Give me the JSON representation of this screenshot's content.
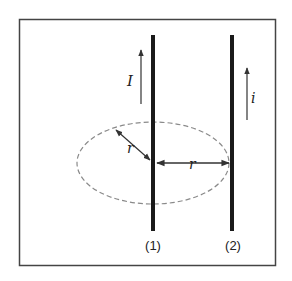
{
  "diagram": {
    "type": "physics-two-parallel-wires",
    "frame": {
      "x": 19,
      "y": 19,
      "width": 256,
      "height": 246,
      "stroke": "#444444"
    },
    "wires": [
      {
        "id": "wire-1",
        "label": "(1)",
        "x": 153,
        "y_top": 35,
        "y_bottom": 230,
        "color": "#1a1a1a"
      },
      {
        "id": "wire-2",
        "label": "(2)",
        "x": 232,
        "y_top": 35,
        "y_bottom": 230,
        "color": "#1a1a1a"
      }
    ],
    "currents": [
      {
        "id": "current-I",
        "symbol": "I",
        "direction": "up",
        "x": 141,
        "y_top": 50,
        "y_bottom": 104
      },
      {
        "id": "current-i",
        "symbol": "i",
        "direction": "up",
        "x": 247,
        "y_top": 68,
        "y_bottom": 120
      }
    ],
    "ellipse": {
      "cx": 153,
      "cy": 163,
      "rx": 76,
      "ry": 41,
      "color": "#888888",
      "style": "dashed"
    },
    "radii": [
      {
        "id": "radius-diagonal",
        "label": "r",
        "from": [
          116,
          130
        ],
        "to": [
          151,
          161
        ]
      },
      {
        "id": "radius-horizontal",
        "label": "r",
        "from": [
          156,
          163
        ],
        "to": [
          229,
          163
        ]
      }
    ],
    "colors": {
      "ink": "#1a1a1a",
      "dash": "#888888",
      "frame": "#444444"
    }
  }
}
